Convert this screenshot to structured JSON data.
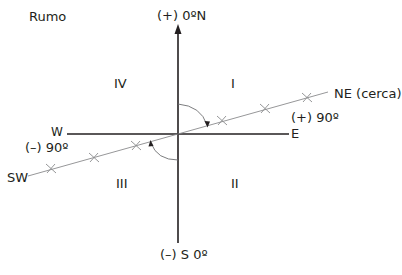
{
  "title": "Rumo",
  "axes": {
    "north": "(+) 0ºN",
    "south": "(–) S 0º",
    "east": "E",
    "west": "W"
  },
  "quadrants": {
    "q1": "I",
    "q2": "II",
    "q3": "III",
    "q4": "IV"
  },
  "bearing_line": {
    "ne_label": "NE (cerca)",
    "sw_label": "SW",
    "ne_angle": "(+) 90º",
    "sw_angle": "(–) 90º"
  },
  "colors": {
    "axis": "#231f20",
    "bearing_line": "#6d6e71",
    "text": "#231f20"
  }
}
